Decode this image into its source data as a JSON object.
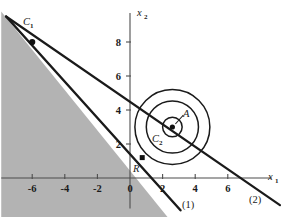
{
  "figure": {
    "title": "",
    "background_color": "#ffffff",
    "shade_color": "#b3b3b3",
    "stroke_color": "#1a1a1a",
    "axis_color": "#555555"
  },
  "axes": {
    "x_label": "x",
    "x_label_sub": "1",
    "y_label": "x",
    "y_label_sub": "2",
    "x_ticks": [
      "-6",
      "-4",
      "-2",
      "0",
      "2",
      "4",
      "6"
    ],
    "x_tick_values": [
      -6,
      -4,
      -2,
      0,
      2,
      4,
      6
    ],
    "y_ticks": [
      "8",
      "6",
      "4",
      "2"
    ],
    "y_tick_values": [
      8,
      6,
      4,
      2
    ],
    "xlim": [
      -7.9,
      9.6
    ],
    "ylim": [
      -2.3,
      10.2
    ]
  },
  "labels": {
    "c1": "C",
    "c1_sub": "1",
    "c2": "C",
    "c2_sub": "2",
    "point_a": "A",
    "region_r": "R",
    "line1": "(1)",
    "line2": "(2)"
  },
  "chart_data": {
    "type": "scatter",
    "title": "",
    "xlabel": "x1",
    "ylabel": "x2",
    "xlim": [
      -7.9,
      9.6
    ],
    "ylim": [
      -2.3,
      10.2
    ],
    "grid": false,
    "legend": "none",
    "lines": [
      {
        "name": "(1)",
        "label": "(1)",
        "points": [
          [
            -7.6,
            9.5
          ],
          [
            3.1,
            -1.9
          ]
        ],
        "slope": -1.07,
        "intercept": 2.0,
        "x_intercept": 2.0,
        "y_intercept": 2.0
      },
      {
        "name": "(2)",
        "label": "(2)",
        "points": [
          [
            -7.6,
            9.5
          ],
          [
            9.2,
            -1.6
          ]
        ],
        "slope": -0.66,
        "intercept": 4.0,
        "x_intercept": 6.2,
        "y_intercept": 4.0
      }
    ],
    "circles": [
      {
        "name": "inner-small",
        "center": [
          2.6,
          3.0
        ],
        "radius": 0.6
      },
      {
        "name": "middle",
        "center": [
          2.6,
          3.0
        ],
        "radius": 1.6
      },
      {
        "name": "outer",
        "center": [
          2.6,
          3.0
        ],
        "radius": 2.3
      }
    ],
    "points": [
      {
        "name": "C1",
        "label": "C1",
        "x": -6.0,
        "y": 8.0
      },
      {
        "name": "C2",
        "label": "C2",
        "x": 2.6,
        "y": 3.0
      },
      {
        "name": "R",
        "label": "R",
        "x": 0.75,
        "y": 1.2
      }
    ],
    "shaded_region": {
      "name": "feasible-region",
      "description": "region below line (1)",
      "color": "#b3b3b3",
      "vertices": [
        [
          -7.9,
          9.8
        ],
        [
          2.3,
          -2.3
        ],
        [
          -7.9,
          -2.3
        ]
      ]
    },
    "annotations": [
      {
        "text": "A",
        "x": 3.4,
        "y": 3.9
      },
      {
        "text": "C2",
        "x": 1.9,
        "y": 2.0
      },
      {
        "text": "C1",
        "x": -5.2,
        "y": 8.6
      },
      {
        "text": "R",
        "x": 0.85,
        "y": 0.45
      },
      {
        "text": "(1)",
        "x": 3.5,
        "y": -1.8
      },
      {
        "text": "(2)",
        "x": 7.3,
        "y": -1.3
      }
    ]
  }
}
